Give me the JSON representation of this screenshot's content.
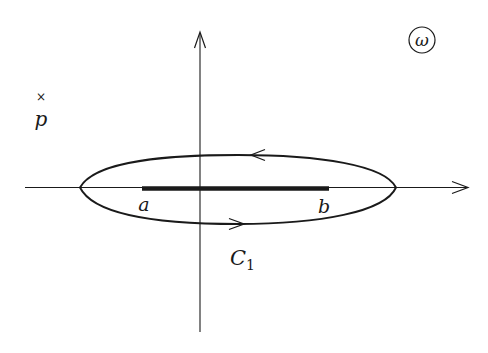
{
  "diagram": {
    "plane_label": "ω",
    "point_marker": "×",
    "point_label": "p",
    "cut_start_label": "a",
    "cut_end_label": "b",
    "contour_label_main": "C",
    "contour_label_sub": "1",
    "colors": {
      "background": "#ffffff",
      "stroke": "#1a1a1a"
    },
    "geometry": {
      "origin": [
        200,
        187
      ],
      "h_axis": {
        "x1": 25,
        "x2": 468,
        "y": 187
      },
      "v_axis": {
        "x": 200,
        "y1": 32,
        "y2": 332
      },
      "ellipse": {
        "cx": 238,
        "cy": 188,
        "rx": 158,
        "ry": 34
      },
      "cut": {
        "x1": 142,
        "x2": 329,
        "y": 188
      },
      "top_arrow_direction": "left",
      "bottom_arrow_direction": "right"
    }
  }
}
